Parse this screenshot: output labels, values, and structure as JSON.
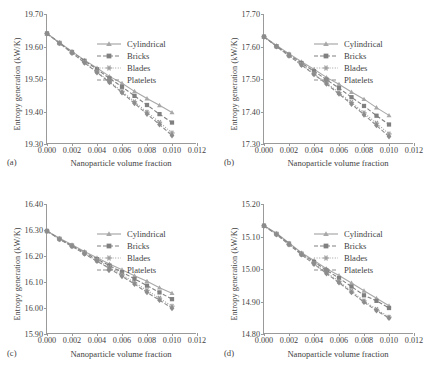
{
  "figure": {
    "xlabel": "Nanoparticle volume fraction",
    "ylabel": "Entropy generation (kW/K)",
    "xticks": [
      "0.000",
      "0.002",
      "0.004",
      "0.006",
      "0.008",
      "0.010",
      "0.012"
    ],
    "xlim": [
      0,
      0.012
    ],
    "series_names": [
      "Cylindrical",
      "Bricks",
      "Blades",
      "Platelets"
    ],
    "colors": {
      "axis": "#9a9a9a",
      "text": "#3f3f3f",
      "cylindrical": "#a8a8a8",
      "bricks": "#808080",
      "blades": "#9e9e9e",
      "platelets": "#8c8c8c"
    },
    "panels": [
      {
        "tag": "(a)",
        "ylim": [
          19.3,
          19.7
        ],
        "yticks": [
          "19.30",
          "19.40",
          "19.50",
          "19.60",
          "19.70"
        ]
      },
      {
        "tag": "(b)",
        "ylim": [
          17.3,
          17.7
        ],
        "yticks": [
          "17.30",
          "17.40",
          "17.50",
          "17.60",
          "17.70"
        ]
      },
      {
        "tag": "(c)",
        "ylim": [
          15.9,
          16.4
        ],
        "yticks": [
          "15.90",
          "16.00",
          "16.10",
          "16.20",
          "16.30",
          "16.40"
        ]
      },
      {
        "tag": "(d)",
        "ylim": [
          14.8,
          15.2
        ],
        "yticks": [
          "14.80",
          "14.90",
          "15.00",
          "15.10",
          "15.20"
        ]
      }
    ]
  },
  "chart_data": [
    {
      "type": "line",
      "panel": "(a)",
      "title": "",
      "xlabel": "Nanoparticle volume fraction",
      "ylabel": "Entropy generation (kW/K)",
      "xlim": [
        0,
        0.012
      ],
      "ylim": [
        19.3,
        19.7
      ],
      "grid": false,
      "legend_position": "upper right",
      "x": [
        0.0,
        0.001,
        0.002,
        0.003,
        0.004,
        0.005,
        0.006,
        0.007,
        0.008,
        0.009,
        0.01
      ],
      "series": [
        {
          "name": "Cylindrical",
          "marker": "triangle",
          "values": [
            19.64,
            19.612,
            19.585,
            19.558,
            19.534,
            19.508,
            19.487,
            19.462,
            19.44,
            19.419,
            19.397
          ]
        },
        {
          "name": "Bricks",
          "marker": "square",
          "values": [
            19.64,
            19.611,
            19.583,
            19.556,
            19.53,
            19.502,
            19.476,
            19.448,
            19.42,
            19.392,
            19.366
          ]
        },
        {
          "name": "Blades",
          "marker": "asterisk",
          "values": [
            19.64,
            19.61,
            19.581,
            19.552,
            19.522,
            19.492,
            19.462,
            19.43,
            19.398,
            19.367,
            19.334
          ]
        },
        {
          "name": "Platelets",
          "marker": "diamond",
          "values": [
            19.64,
            19.61,
            19.58,
            19.55,
            19.52,
            19.49,
            19.458,
            19.425,
            19.392,
            19.36,
            19.326
          ]
        }
      ]
    },
    {
      "type": "line",
      "panel": "(b)",
      "title": "",
      "xlabel": "Nanoparticle volume fraction",
      "ylabel": "Entropy generation (kW/K)",
      "xlim": [
        0,
        0.012
      ],
      "ylim": [
        17.3,
        17.7
      ],
      "grid": false,
      "legend_position": "upper right",
      "x": [
        0.0,
        0.001,
        0.002,
        0.003,
        0.004,
        0.005,
        0.006,
        0.007,
        0.008,
        0.009,
        0.01
      ],
      "series": [
        {
          "name": "Cylindrical",
          "marker": "triangle",
          "values": [
            17.63,
            17.603,
            17.578,
            17.553,
            17.53,
            17.505,
            17.484,
            17.46,
            17.438,
            17.412,
            17.388
          ]
        },
        {
          "name": "Bricks",
          "marker": "square",
          "values": [
            17.63,
            17.601,
            17.575,
            17.549,
            17.524,
            17.498,
            17.472,
            17.444,
            17.417,
            17.387,
            17.36
          ]
        },
        {
          "name": "Blades",
          "marker": "asterisk",
          "values": [
            17.63,
            17.6,
            17.572,
            17.545,
            17.516,
            17.488,
            17.458,
            17.428,
            17.396,
            17.364,
            17.331
          ]
        },
        {
          "name": "Platelets",
          "marker": "diamond",
          "values": [
            17.63,
            17.6,
            17.571,
            17.543,
            17.514,
            17.485,
            17.454,
            17.423,
            17.39,
            17.357,
            17.323
          ]
        }
      ]
    },
    {
      "type": "line",
      "panel": "(c)",
      "title": "",
      "xlabel": "Nanoparticle volume fraction",
      "ylabel": "Entropy generation (kW/K)",
      "xlim": [
        0,
        0.012
      ],
      "ylim": [
        15.9,
        16.4
      ],
      "grid": false,
      "legend_position": "upper right",
      "x": [
        0.0,
        0.001,
        0.002,
        0.003,
        0.004,
        0.005,
        0.006,
        0.007,
        0.008,
        0.009,
        0.01
      ],
      "series": [
        {
          "name": "Cylindrical",
          "marker": "triangle",
          "values": [
            16.296,
            16.268,
            16.243,
            16.217,
            16.193,
            16.169,
            16.147,
            16.124,
            16.103,
            16.078,
            16.057
          ]
        },
        {
          "name": "Bricks",
          "marker": "square",
          "values": [
            16.296,
            16.266,
            16.24,
            16.213,
            16.188,
            16.163,
            16.138,
            16.112,
            16.086,
            16.06,
            16.034
          ]
        },
        {
          "name": "Blades",
          "marker": "asterisk",
          "values": [
            16.296,
            16.265,
            16.238,
            16.21,
            16.183,
            16.156,
            16.128,
            16.098,
            16.068,
            16.038,
            16.007
          ]
        },
        {
          "name": "Platelets",
          "marker": "diamond",
          "values": [
            16.296,
            16.264,
            16.237,
            16.208,
            16.18,
            16.152,
            16.122,
            16.092,
            16.06,
            16.03,
            15.999
          ]
        }
      ]
    },
    {
      "type": "line",
      "panel": "(d)",
      "title": "",
      "xlabel": "Nanoparticle volume fraction",
      "ylabel": "Entropy generation (kW/K)",
      "xlim": [
        0,
        0.012
      ],
      "ylim": [
        14.8,
        15.2
      ],
      "grid": false,
      "legend_position": "upper right",
      "x": [
        0.0,
        0.001,
        0.002,
        0.003,
        0.004,
        0.005,
        0.006,
        0.007,
        0.008,
        0.009,
        0.01
      ],
      "series": [
        {
          "name": "Cylindrical",
          "marker": "triangle",
          "values": [
            15.133,
            15.11,
            15.08,
            15.05,
            15.026,
            15.001,
            14.98,
            14.957,
            14.933,
            14.91,
            14.887
          ]
        },
        {
          "name": "Bricks",
          "marker": "square",
          "values": [
            15.133,
            15.108,
            15.078,
            15.047,
            15.022,
            14.996,
            14.972,
            14.946,
            14.919,
            14.902,
            14.88
          ]
        },
        {
          "name": "Blades",
          "marker": "asterisk",
          "values": [
            15.133,
            15.107,
            15.076,
            15.045,
            15.017,
            14.989,
            14.962,
            14.932,
            14.902,
            14.876,
            14.852
          ]
        },
        {
          "name": "Platelets",
          "marker": "diamond",
          "values": [
            15.133,
            15.106,
            15.075,
            15.044,
            15.015,
            14.986,
            14.958,
            14.928,
            14.898,
            14.872,
            14.849
          ]
        }
      ]
    }
  ]
}
